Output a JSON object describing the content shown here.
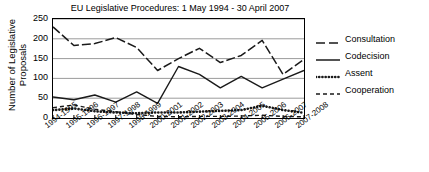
{
  "chart_data": {
    "type": "line",
    "title": "EU Legislative Procedures: 1 May 1994 - 30 April 2007",
    "xlabel": "",
    "ylabel": "Number of Legislative Proposals",
    "ylim": [
      0,
      250
    ],
    "yticks": [
      "0",
      "50",
      "100",
      "150",
      "200",
      "250"
    ],
    "grid": true,
    "legend_position": "right",
    "categories": [
      "1994-1995",
      "1995-1996",
      "1996-1997",
      "1997-1998",
      "1998-1999",
      "2000-2001",
      "2001-2002",
      "2002-2003",
      "2003-2004",
      "2004-2005",
      "2005-2006",
      "2006-2007",
      "2007-2008"
    ],
    "series": [
      {
        "name": "Consultation",
        "style": "long-dash-dot",
        "values": [
          230,
          183,
          188,
          203,
          178,
          120,
          150,
          176,
          140,
          158,
          196,
          110,
          148
        ]
      },
      {
        "name": "Codecision",
        "style": "solid",
        "values": [
          53,
          46,
          58,
          40,
          66,
          37,
          130,
          110,
          76,
          105,
          76,
          98,
          120
        ]
      },
      {
        "name": "Assent",
        "style": "dotted",
        "values": [
          20,
          24,
          17,
          14,
          12,
          14,
          14,
          16,
          18,
          20,
          31,
          20,
          13
        ]
      },
      {
        "name": "Cooperation",
        "style": "dashed",
        "values": [
          26,
          33,
          22,
          16,
          9,
          4,
          3,
          4,
          4,
          5,
          7,
          4,
          3
        ]
      }
    ]
  },
  "legend": {
    "items": [
      {
        "label": "Consultation"
      },
      {
        "label": "Codecision"
      },
      {
        "label": "Assent"
      },
      {
        "label": "Cooperation"
      }
    ]
  }
}
